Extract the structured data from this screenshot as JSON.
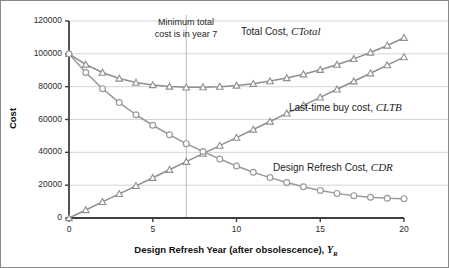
{
  "figure": {
    "annotation_line1": "Minimum total",
    "annotation_line2": "cost is in year 7"
  },
  "axes": {
    "ylabel": "Cost",
    "xlabel_main": "Design Refresh Year (after obsolescence),",
    "xlabel_symbol": "Y",
    "xlabel_symbol_sub": "R",
    "y_ticks": [
      "0",
      "20000",
      "40000",
      "60000",
      "80000",
      "100000",
      "120000"
    ],
    "x_ticks": [
      "0",
      "5",
      "10",
      "15",
      "20"
    ]
  },
  "series_labels": {
    "total": {
      "text": "Total Cost, ",
      "symbol": "C",
      "sub": "Total"
    },
    "ltb": {
      "text": "Last-time buy cost, ",
      "symbol": "C",
      "sub": "LTB"
    },
    "dr": {
      "text": "Design Refresh Cost, ",
      "symbol": "C",
      "sub": "DR"
    }
  },
  "colors": {
    "grid": "#c9c9c9",
    "axis": "#3f3f3f",
    "series_total": "#8f8f8f",
    "series_ltb": "#8f8f8f",
    "series_dr": "#9a9a9a",
    "reference_line": "#b5b5b5",
    "border": "#8a8a8a"
  },
  "chart_data": {
    "type": "line",
    "title": "",
    "xlabel": "Design Refresh Year (after obsolescence), Y_R",
    "ylabel": "Cost",
    "xlim": [
      0,
      20
    ],
    "ylim": [
      0,
      120000
    ],
    "xticks": [
      0,
      5,
      10,
      15,
      20
    ],
    "yticks": [
      0,
      20000,
      40000,
      60000,
      80000,
      100000,
      120000
    ],
    "grid": "horizontal",
    "legend": "inline-annotations",
    "annotations": [
      {
        "text": "Minimum total cost is in year 7",
        "x": 7,
        "y": 115000
      },
      {
        "type": "vline",
        "x": 7,
        "label": "minimum total cost year"
      }
    ],
    "x": [
      0,
      1,
      2,
      3,
      4,
      5,
      6,
      7,
      8,
      9,
      10,
      11,
      12,
      13,
      14,
      15,
      16,
      17,
      18,
      19,
      20
    ],
    "series": [
      {
        "name": "Total Cost, C_Total",
        "marker": "triangle",
        "values": [
          100000,
          93500,
          88600,
          85000,
          82500,
          81000,
          80100,
          79600,
          79700,
          80000,
          80700,
          81800,
          83400,
          85300,
          87600,
          90300,
          93400,
          96900,
          100800,
          105100,
          109800
        ]
      },
      {
        "name": "Last-time buy cost, C_LTB",
        "marker": "triangle",
        "values": [
          0,
          4900,
          9800,
          14700,
          19600,
          24500,
          29400,
          34300,
          39200,
          44100,
          49000,
          53900,
          58800,
          63700,
          68600,
          73500,
          78400,
          83300,
          88200,
          93100,
          98000
        ]
      },
      {
        "name": "Design Refresh Cost, C_DR",
        "marker": "circle",
        "values": [
          100000,
          88600,
          78800,
          70300,
          62900,
          56500,
          50700,
          45300,
          40500,
          35900,
          31700,
          27900,
          24600,
          21600,
          19000,
          16800,
          15000,
          13600,
          12600,
          12000,
          11800
        ]
      }
    ]
  }
}
